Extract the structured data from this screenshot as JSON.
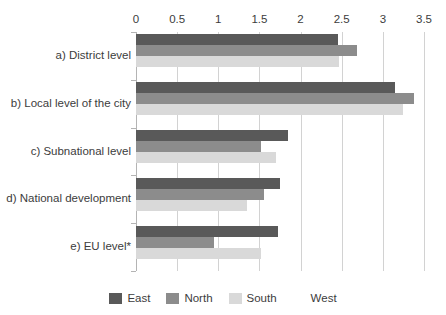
{
  "chart_data": {
    "type": "bar",
    "orientation": "horizontal",
    "title": "",
    "xlabel": "",
    "ylabel": "",
    "xlim": [
      0,
      3.5
    ],
    "xticks": [
      0,
      0.5,
      1,
      1.5,
      2,
      2.5,
      3,
      3.5
    ],
    "xtick_labels": [
      "0",
      "0.5",
      "1",
      "1.5",
      "2",
      "2.5",
      "3",
      "3.5"
    ],
    "grid": true,
    "legend_position": "bottom",
    "categories": [
      "a) District level",
      "b) Local level of the city",
      "c) Subnational level",
      "d) National development",
      "e) EU level*"
    ],
    "series": [
      {
        "name": "East",
        "color": "#595959",
        "values": [
          2.45,
          3.15,
          1.85,
          1.75,
          1.72
        ]
      },
      {
        "name": "North",
        "color": "#8c8c8c",
        "values": [
          2.68,
          3.38,
          1.52,
          1.55,
          0.95
        ]
      },
      {
        "name": "South",
        "color": "#d9d9d9",
        "values": [
          2.47,
          3.25,
          1.7,
          1.35,
          1.52
        ]
      },
      {
        "name": "West",
        "color": "#ffffff",
        "values": [
          0,
          0,
          0,
          0,
          0
        ]
      }
    ]
  },
  "legend": {
    "entries": [
      {
        "label": "East",
        "color": "#595959"
      },
      {
        "label": "North",
        "color": "#8c8c8c"
      },
      {
        "label": "South",
        "color": "#d9d9d9"
      },
      {
        "label": "West",
        "color": "#ffffff"
      }
    ]
  }
}
